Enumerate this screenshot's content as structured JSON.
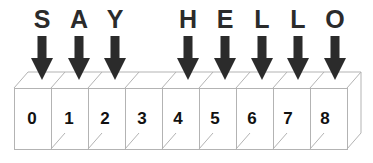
{
  "diagram": {
    "word": "SAY HELLO",
    "line_color": "#b3b3b3",
    "arrow_color": "#2b2b2b",
    "text_color": "#111111",
    "background_color": "#ffffff",
    "letters": [
      {
        "char": "S",
        "slot": 0,
        "x": 42
      },
      {
        "char": "A",
        "slot": 1,
        "x": 79
      },
      {
        "char": "Y",
        "slot": 2,
        "x": 115
      },
      {
        "char": "H",
        "slot": 4,
        "x": 188
      },
      {
        "char": "E",
        "slot": 5,
        "x": 225
      },
      {
        "char": "L",
        "slot": 6,
        "x": 262
      },
      {
        "char": "L",
        "slot": 7,
        "x": 298
      },
      {
        "char": "O",
        "slot": 8,
        "x": 335
      }
    ],
    "arrows": [
      {
        "slot": 0,
        "x": 42
      },
      {
        "slot": 1,
        "x": 79
      },
      {
        "slot": 2,
        "x": 115
      },
      {
        "slot": 4,
        "x": 188
      },
      {
        "slot": 5,
        "x": 225
      },
      {
        "slot": 6,
        "x": 262
      },
      {
        "slot": 7,
        "x": 298
      },
      {
        "slot": 8,
        "x": 335
      }
    ],
    "cells": [
      {
        "index": "0",
        "x": 32
      },
      {
        "index": "1",
        "x": 69
      },
      {
        "index": "2",
        "x": 105
      },
      {
        "index": "3",
        "x": 142
      },
      {
        "index": "4",
        "x": 178
      },
      {
        "index": "5",
        "x": 215
      },
      {
        "index": "6",
        "x": 252
      },
      {
        "index": "7",
        "x": 288
      },
      {
        "index": "8",
        "x": 325
      }
    ],
    "geometry": {
      "front_left": 14,
      "front_top": 88,
      "front_bottom": 149,
      "cell_width": 37,
      "cell_count": 9,
      "depth_dx": 14,
      "depth_dy": -16
    }
  }
}
